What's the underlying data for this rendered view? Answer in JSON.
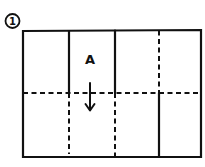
{
  "diagram": {
    "step_number": "1",
    "panel_label": "A",
    "arrow_direction": "down",
    "ink_color": "#111111",
    "background": "#ffffff",
    "sheet": {
      "columns": 4,
      "rows": 2,
      "top_row_fold_lines": [
        "solid",
        "solid",
        "dashed"
      ],
      "bottom_row_fold_lines": [
        "dashed",
        "dashed",
        "solid"
      ],
      "horizontal_fold": "dashed"
    }
  }
}
